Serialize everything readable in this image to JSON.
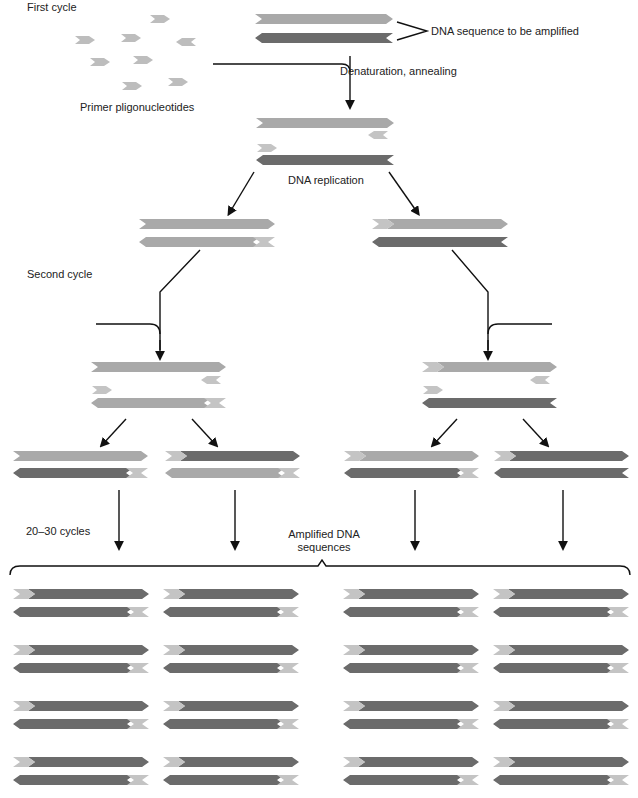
{
  "colors": {
    "light": "#c4c4c4",
    "medium": "#a9a9a9",
    "dark": "#6b6b6b",
    "primer": "#bdbdbd",
    "line": "#111111"
  },
  "labels": {
    "first_cycle": "First cycle",
    "primers": "Primer pligonucleotides",
    "dna_target": "DNA sequence to be amplified",
    "denaturation": "Denaturation, annealing",
    "replication": "DNA replication",
    "second_cycle": "Second cycle",
    "cycles": "20–30 cycles",
    "amplified_line1": "Amplified DNA",
    "amplified_line2": "sequences"
  },
  "stages": [
    {
      "name": "original-template",
      "strands": [
        "medium",
        "dark"
      ]
    },
    {
      "name": "annealed-template",
      "strands": [
        "medium-with-primer",
        "dark-with-primer"
      ]
    },
    {
      "name": "first-products",
      "left": [
        "medium",
        "medium-with-primer-tail"
      ],
      "right": [
        "light-primer-head+medium",
        "dark"
      ]
    },
    {
      "name": "second-cycle-annealing",
      "count": 2
    },
    {
      "name": "second-products",
      "count": 4
    },
    {
      "name": "amplified-sequences",
      "columns": 4,
      "rows": 4
    }
  ]
}
